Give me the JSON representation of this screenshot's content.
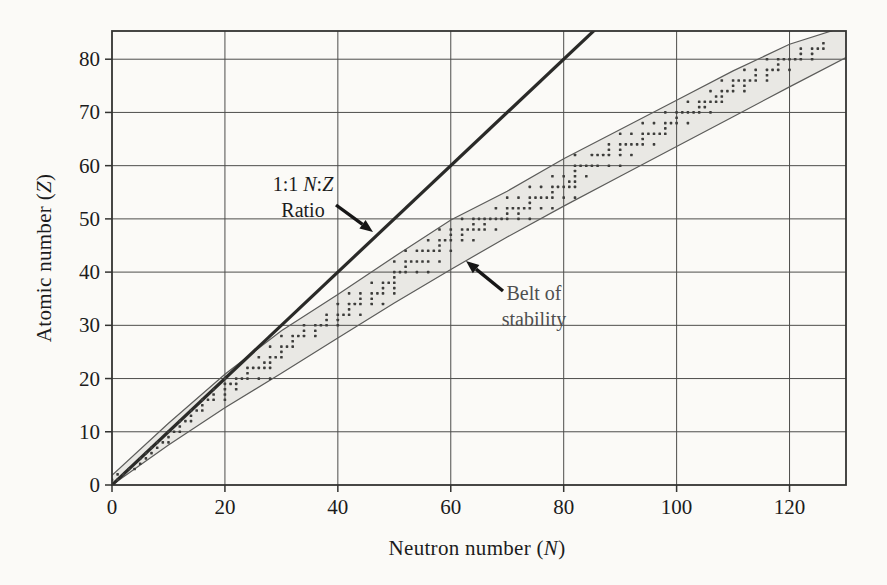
{
  "chart_data": {
    "type": "scatter",
    "title": "",
    "xlabel": {
      "prefix": "Neutron number (",
      "var": "N",
      "suffix": ")"
    },
    "ylabel": {
      "prefix": "Atomic number (",
      "var": "Z",
      "suffix": ")"
    },
    "xlim": [
      0,
      130
    ],
    "ylim": [
      0,
      85.3
    ],
    "x_ticks": [
      0,
      20,
      40,
      60,
      80,
      100,
      120
    ],
    "y_ticks": [
      0,
      10,
      20,
      30,
      40,
      50,
      60,
      70,
      80
    ],
    "grid": true,
    "legend": "none",
    "ratio_line": {
      "label_line1_prefix": "1:1 ",
      "label_var1": "N",
      "label_colon": ":",
      "label_var2": "Z",
      "label_line2": "Ratio",
      "from": [
        0,
        0
      ],
      "to": [
        86,
        86
      ]
    },
    "belt": {
      "label_line1": "Belt of",
      "label_line2": "stability",
      "upper": [
        [
          0,
          1.8
        ],
        [
          10,
          11.6
        ],
        [
          20,
          20.8
        ],
        [
          30,
          29
        ],
        [
          40,
          35.8
        ],
        [
          50,
          42.9
        ],
        [
          60,
          49.8
        ],
        [
          70,
          55.2
        ],
        [
          80,
          61.3
        ],
        [
          90,
          66.8
        ],
        [
          100,
          72.3
        ],
        [
          110,
          77.8
        ],
        [
          120,
          82.8
        ],
        [
          128,
          85.5
        ],
        [
          131,
          86.8
        ]
      ],
      "lower": [
        [
          0,
          0
        ],
        [
          10,
          7.5
        ],
        [
          20,
          14.5
        ],
        [
          30,
          21
        ],
        [
          40,
          27.6
        ],
        [
          50,
          34.2
        ],
        [
          60,
          40.5
        ],
        [
          70,
          46.6
        ],
        [
          80,
          52.4
        ],
        [
          90,
          58
        ],
        [
          100,
          63.6
        ],
        [
          110,
          69.2
        ],
        [
          120,
          74.8
        ],
        [
          130,
          80.3
        ],
        [
          132,
          81.4
        ]
      ]
    },
    "points": [
      [
        0,
        1
      ],
      [
        1,
        1
      ],
      [
        1,
        2
      ],
      [
        2,
        2
      ],
      [
        3,
        3
      ],
      [
        4,
        3
      ],
      [
        5,
        4
      ],
      [
        5,
        5
      ],
      [
        6,
        5
      ],
      [
        6,
        6
      ],
      [
        7,
        6
      ],
      [
        7,
        7
      ],
      [
        8,
        7
      ],
      [
        8,
        8
      ],
      [
        9,
        8
      ],
      [
        10,
        8
      ],
      [
        10,
        9
      ],
      [
        10,
        10
      ],
      [
        11,
        10
      ],
      [
        12,
        10
      ],
      [
        12,
        11
      ],
      [
        12,
        12
      ],
      [
        13,
        12
      ],
      [
        14,
        12
      ],
      [
        14,
        13
      ],
      [
        14,
        14
      ],
      [
        15,
        14
      ],
      [
        16,
        14
      ],
      [
        16,
        15
      ],
      [
        16,
        16
      ],
      [
        17,
        16
      ],
      [
        18,
        16
      ],
      [
        20,
        16
      ],
      [
        18,
        17
      ],
      [
        20,
        17
      ],
      [
        18,
        18
      ],
      [
        20,
        18
      ],
      [
        22,
        18
      ],
      [
        20,
        19
      ],
      [
        21,
        19
      ],
      [
        22,
        19
      ],
      [
        20,
        20
      ],
      [
        22,
        20
      ],
      [
        23,
        20
      ],
      [
        24,
        20
      ],
      [
        26,
        20
      ],
      [
        28,
        20
      ],
      [
        24,
        21
      ],
      [
        24,
        22
      ],
      [
        25,
        22
      ],
      [
        26,
        22
      ],
      [
        27,
        22
      ],
      [
        28,
        22
      ],
      [
        27,
        23
      ],
      [
        28,
        23
      ],
      [
        26,
        24
      ],
      [
        28,
        24
      ],
      [
        29,
        24
      ],
      [
        30,
        24
      ],
      [
        30,
        25
      ],
      [
        28,
        26
      ],
      [
        30,
        26
      ],
      [
        31,
        26
      ],
      [
        32,
        26
      ],
      [
        32,
        27
      ],
      [
        30,
        28
      ],
      [
        32,
        28
      ],
      [
        33,
        28
      ],
      [
        34,
        28
      ],
      [
        36,
        28
      ],
      [
        34,
        29
      ],
      [
        36,
        29
      ],
      [
        34,
        30
      ],
      [
        36,
        30
      ],
      [
        37,
        30
      ],
      [
        38,
        30
      ],
      [
        40,
        30
      ],
      [
        38,
        31
      ],
      [
        40,
        31
      ],
      [
        38,
        32
      ],
      [
        40,
        32
      ],
      [
        41,
        32
      ],
      [
        42,
        32
      ],
      [
        44,
        32
      ],
      [
        42,
        33
      ],
      [
        40,
        34
      ],
      [
        42,
        34
      ],
      [
        43,
        34
      ],
      [
        44,
        34
      ],
      [
        46,
        34
      ],
      [
        48,
        34
      ],
      [
        44,
        35
      ],
      [
        46,
        35
      ],
      [
        42,
        36
      ],
      [
        44,
        36
      ],
      [
        46,
        36
      ],
      [
        47,
        36
      ],
      [
        48,
        36
      ],
      [
        50,
        36
      ],
      [
        48,
        37
      ],
      [
        50,
        37
      ],
      [
        46,
        38
      ],
      [
        48,
        38
      ],
      [
        49,
        38
      ],
      [
        50,
        38
      ],
      [
        50,
        39
      ],
      [
        50,
        40
      ],
      [
        51,
        40
      ],
      [
        52,
        40
      ],
      [
        54,
        40
      ],
      [
        56,
        40
      ],
      [
        52,
        41
      ],
      [
        50,
        42
      ],
      [
        52,
        42
      ],
      [
        53,
        42
      ],
      [
        54,
        42
      ],
      [
        55,
        42
      ],
      [
        56,
        42
      ],
      [
        58,
        42
      ],
      [
        52,
        44
      ],
      [
        54,
        44
      ],
      [
        55,
        44
      ],
      [
        56,
        44
      ],
      [
        57,
        44
      ],
      [
        58,
        44
      ],
      [
        60,
        44
      ],
      [
        58,
        45
      ],
      [
        56,
        46
      ],
      [
        58,
        46
      ],
      [
        59,
        46
      ],
      [
        60,
        46
      ],
      [
        62,
        46
      ],
      [
        64,
        46
      ],
      [
        60,
        47
      ],
      [
        62,
        47
      ],
      [
        58,
        48
      ],
      [
        60,
        48
      ],
      [
        62,
        48
      ],
      [
        63,
        48
      ],
      [
        64,
        48
      ],
      [
        65,
        48
      ],
      [
        66,
        48
      ],
      [
        68,
        48
      ],
      [
        64,
        49
      ],
      [
        66,
        49
      ],
      [
        62,
        50
      ],
      [
        64,
        50
      ],
      [
        65,
        50
      ],
      [
        66,
        50
      ],
      [
        67,
        50
      ],
      [
        68,
        50
      ],
      [
        69,
        50
      ],
      [
        70,
        50
      ],
      [
        72,
        50
      ],
      [
        74,
        50
      ],
      [
        70,
        51
      ],
      [
        72,
        51
      ],
      [
        68,
        52
      ],
      [
        70,
        52
      ],
      [
        71,
        52
      ],
      [
        72,
        52
      ],
      [
        73,
        52
      ],
      [
        74,
        52
      ],
      [
        76,
        52
      ],
      [
        78,
        52
      ],
      [
        74,
        53
      ],
      [
        70,
        54
      ],
      [
        72,
        54
      ],
      [
        74,
        54
      ],
      [
        75,
        54
      ],
      [
        76,
        54
      ],
      [
        77,
        54
      ],
      [
        78,
        54
      ],
      [
        80,
        54
      ],
      [
        82,
        54
      ],
      [
        78,
        55
      ],
      [
        74,
        56
      ],
      [
        76,
        56
      ],
      [
        78,
        56
      ],
      [
        79,
        56
      ],
      [
        80,
        56
      ],
      [
        81,
        56
      ],
      [
        82,
        56
      ],
      [
        81,
        57
      ],
      [
        82,
        57
      ],
      [
        78,
        58
      ],
      [
        80,
        58
      ],
      [
        82,
        58
      ],
      [
        84,
        58
      ],
      [
        82,
        59
      ],
      [
        82,
        60
      ],
      [
        83,
        60
      ],
      [
        84,
        60
      ],
      [
        85,
        60
      ],
      [
        86,
        60
      ],
      [
        88,
        60
      ],
      [
        90,
        60
      ],
      [
        82,
        62
      ],
      [
        85,
        62
      ],
      [
        86,
        62
      ],
      [
        87,
        62
      ],
      [
        88,
        62
      ],
      [
        90,
        62
      ],
      [
        92,
        62
      ],
      [
        88,
        63
      ],
      [
        90,
        63
      ],
      [
        88,
        64
      ],
      [
        90,
        64
      ],
      [
        91,
        64
      ],
      [
        92,
        64
      ],
      [
        93,
        64
      ],
      [
        94,
        64
      ],
      [
        96,
        64
      ],
      [
        94,
        65
      ],
      [
        90,
        66
      ],
      [
        92,
        66
      ],
      [
        94,
        66
      ],
      [
        95,
        66
      ],
      [
        96,
        66
      ],
      [
        97,
        66
      ],
      [
        98,
        66
      ],
      [
        98,
        67
      ],
      [
        94,
        68
      ],
      [
        96,
        68
      ],
      [
        98,
        68
      ],
      [
        99,
        68
      ],
      [
        100,
        68
      ],
      [
        102,
        68
      ],
      [
        100,
        69
      ],
      [
        98,
        70
      ],
      [
        100,
        70
      ],
      [
        101,
        70
      ],
      [
        102,
        70
      ],
      [
        103,
        70
      ],
      [
        104,
        70
      ],
      [
        106,
        70
      ],
      [
        104,
        71
      ],
      [
        105,
        71
      ],
      [
        102,
        72
      ],
      [
        104,
        72
      ],
      [
        105,
        72
      ],
      [
        106,
        72
      ],
      [
        107,
        72
      ],
      [
        108,
        72
      ],
      [
        107,
        73
      ],
      [
        108,
        73
      ],
      [
        106,
        74
      ],
      [
        108,
        74
      ],
      [
        109,
        74
      ],
      [
        110,
        74
      ],
      [
        112,
        74
      ],
      [
        110,
        75
      ],
      [
        112,
        75
      ],
      [
        108,
        76
      ],
      [
        110,
        76
      ],
      [
        111,
        76
      ],
      [
        112,
        76
      ],
      [
        113,
        76
      ],
      [
        114,
        76
      ],
      [
        116,
        76
      ],
      [
        114,
        77
      ],
      [
        116,
        77
      ],
      [
        112,
        78
      ],
      [
        114,
        78
      ],
      [
        116,
        78
      ],
      [
        117,
        78
      ],
      [
        118,
        78
      ],
      [
        120,
        78
      ],
      [
        118,
        79
      ],
      [
        116,
        80
      ],
      [
        118,
        80
      ],
      [
        119,
        80
      ],
      [
        120,
        80
      ],
      [
        121,
        80
      ],
      [
        122,
        80
      ],
      [
        124,
        80
      ],
      [
        122,
        81
      ],
      [
        124,
        81
      ],
      [
        122,
        82
      ],
      [
        124,
        82
      ],
      [
        125,
        82
      ],
      [
        126,
        82
      ],
      [
        126,
        83
      ]
    ],
    "style": {
      "background": "#fbfaf7",
      "grid_color": "#4d4d4b",
      "frame_color": "#333331",
      "tick_color": "#333331",
      "text_color": "#1c1c1c",
      "ratio_line_color": "#2a2a28",
      "belt_fill": "#e9e8e4",
      "belt_edge_color": "#5c5c5a",
      "dot_color": "#3d3d3b",
      "arrow_color": "#161616",
      "belt_label_color": "#4f4f4f"
    }
  }
}
